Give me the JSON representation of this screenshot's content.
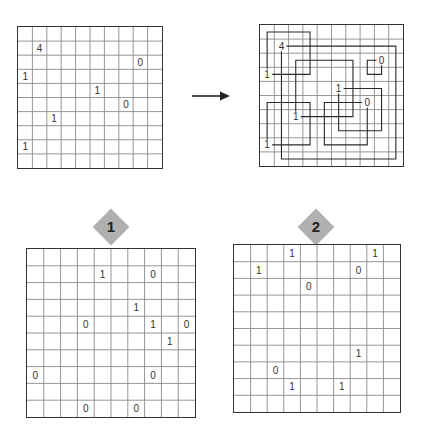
{
  "colors": {
    "grid_line": "#8a8a8a",
    "border": "#333333",
    "solution_line": "#2a2a2a",
    "badge": "#b0b0b0",
    "text": "#333333"
  },
  "example": {
    "rows": 10,
    "cols": 10,
    "clues": [
      {
        "r": 1,
        "c": 1,
        "v": "4"
      },
      {
        "r": 2,
        "c": 8,
        "v": "0"
      },
      {
        "r": 3,
        "c": 0,
        "v": "1"
      },
      {
        "r": 4,
        "c": 5,
        "v": "1"
      },
      {
        "r": 5,
        "c": 7,
        "v": "0"
      },
      {
        "r": 6,
        "c": 2,
        "v": "1"
      },
      {
        "r": 8,
        "c": 0,
        "v": "1"
      }
    ]
  },
  "arrow": {
    "icon": "arrow-right-icon"
  },
  "solution": {
    "rows": 10,
    "cols": 10,
    "clues": [
      {
        "r": 1,
        "c": 1,
        "v": "4"
      },
      {
        "r": 2,
        "c": 8,
        "v": "0"
      },
      {
        "r": 3,
        "c": 0,
        "v": "1"
      },
      {
        "r": 4,
        "c": 5,
        "v": "1"
      },
      {
        "r": 5,
        "c": 7,
        "v": "0"
      },
      {
        "r": 6,
        "c": 2,
        "v": "1"
      },
      {
        "r": 8,
        "c": 0,
        "v": "1"
      }
    ],
    "squares": [
      {
        "clue": {
          "r": 3,
          "c": 0
        },
        "r0": 0,
        "c0": 0,
        "r1": 3,
        "c1": 3
      },
      {
        "clue": {
          "r": 1,
          "c": 1
        },
        "r0": 1,
        "c0": 1,
        "r1": 9,
        "c1": 9
      },
      {
        "clue": {
          "r": 2,
          "c": 8
        },
        "r0": 2,
        "c0": 7,
        "r1": 3,
        "c1": 8
      },
      {
        "clue": {
          "r": 6,
          "c": 2
        },
        "r0": 2,
        "c0": 2,
        "r1": 6,
        "c1": 6
      },
      {
        "clue": {
          "r": 4,
          "c": 5
        },
        "r0": 4,
        "c0": 5,
        "r1": 7,
        "c1": 8
      },
      {
        "clue": {
          "r": 5,
          "c": 7
        },
        "r0": 5,
        "c0": 4,
        "r1": 8,
        "c1": 7
      },
      {
        "clue": {
          "r": 8,
          "c": 0
        },
        "r0": 5,
        "c0": 0,
        "r1": 8,
        "c1": 3
      }
    ]
  },
  "puzzles": [
    {
      "label": "1",
      "rows": 10,
      "cols": 10,
      "clues": [
        {
          "r": 1,
          "c": 4,
          "v": "1"
        },
        {
          "r": 1,
          "c": 7,
          "v": "0"
        },
        {
          "r": 3,
          "c": 6,
          "v": "1"
        },
        {
          "r": 4,
          "c": 3,
          "v": "0"
        },
        {
          "r": 4,
          "c": 7,
          "v": "1"
        },
        {
          "r": 4,
          "c": 9,
          "v": "0"
        },
        {
          "r": 5,
          "c": 8,
          "v": "1"
        },
        {
          "r": 7,
          "c": 0,
          "v": "0"
        },
        {
          "r": 7,
          "c": 7,
          "v": "0"
        },
        {
          "r": 9,
          "c": 3,
          "v": "0"
        },
        {
          "r": 9,
          "c": 6,
          "v": "0"
        }
      ]
    },
    {
      "label": "2",
      "rows": 10,
      "cols": 10,
      "clues": [
        {
          "r": 0,
          "c": 3,
          "v": "1"
        },
        {
          "r": 0,
          "c": 8,
          "v": "1"
        },
        {
          "r": 1,
          "c": 1,
          "v": "1"
        },
        {
          "r": 1,
          "c": 7,
          "v": "0"
        },
        {
          "r": 2,
          "c": 4,
          "v": "0"
        },
        {
          "r": 6,
          "c": 7,
          "v": "1"
        },
        {
          "r": 7,
          "c": 2,
          "v": "0"
        },
        {
          "r": 8,
          "c": 3,
          "v": "1"
        },
        {
          "r": 8,
          "c": 6,
          "v": "1"
        }
      ]
    }
  ]
}
